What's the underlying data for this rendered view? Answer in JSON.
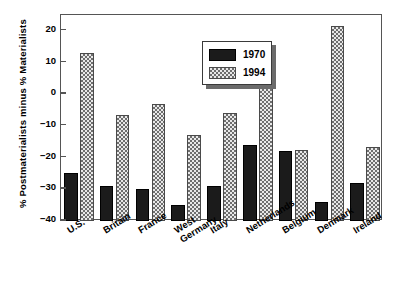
{
  "chart_data": {
    "type": "bar",
    "title": "",
    "xlabel": "",
    "ylabel": "% Postmaterialists minus % Materialists",
    "ylim": [
      -40,
      25
    ],
    "yticks": [
      20,
      10,
      0,
      -10,
      -20,
      -30,
      -40
    ],
    "ytick_labels": [
      "20",
      "10",
      "0",
      "−10",
      "−20",
      "−30",
      "−40"
    ],
    "grid": false,
    "legend_position": "top-center-left",
    "categories": [
      "U.S.",
      "Britain",
      "France",
      "West Germany",
      "Italy",
      "Netherlands",
      "Belgium",
      "Denmark",
      "Ireland"
    ],
    "category_lines": [
      [
        "U.S."
      ],
      [
        "Britain"
      ],
      [
        "France"
      ],
      [
        "West",
        "Germany"
      ],
      [
        "Italy"
      ],
      [
        "Netherlands"
      ],
      [
        "Belgium"
      ],
      [
        "Denmark"
      ],
      [
        "Ireland"
      ]
    ],
    "series": [
      {
        "name": "1970",
        "color": "#1b1b1b",
        "pattern": "solid",
        "values": [
          -25,
          -29,
          -30,
          -35,
          -29,
          -16,
          -18,
          -34,
          -28
        ]
      },
      {
        "name": "1994",
        "color": "#e8e8e8",
        "pattern": "checkered",
        "values": [
          13,
          -6.5,
          -3,
          -13,
          -6,
          7,
          -17.5,
          21.5,
          -16.5
        ]
      }
    ]
  },
  "legend": {
    "items": [
      {
        "label": "1970",
        "swatch": "solid-black"
      },
      {
        "label": "1994",
        "swatch": "checkered-gray"
      }
    ]
  }
}
